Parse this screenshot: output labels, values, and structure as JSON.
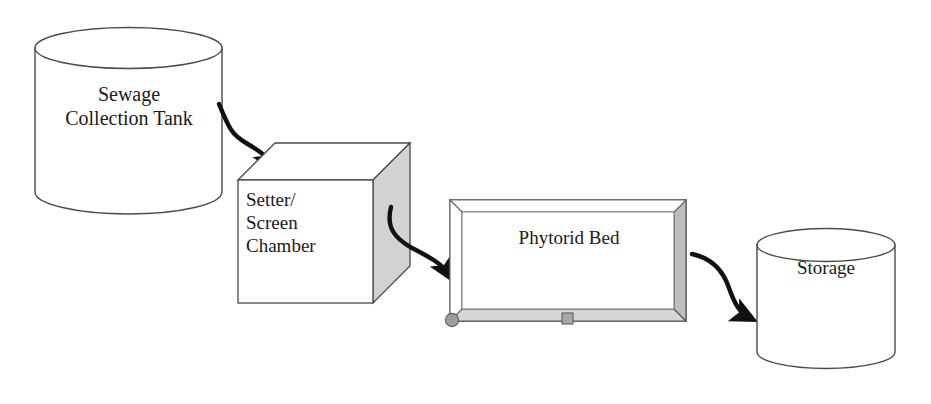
{
  "diagram": {
    "background_color": "#ffffff",
    "stroke_color": "#3a3a3a",
    "arrow_color": "#111111",
    "fill_white": "#ffffff",
    "fill_gray_light": "#d9d9d9",
    "fill_gray_mid": "#cfcfcf",
    "fill_gray_dark": "#9a9a9a",
    "nodes": [
      {
        "id": "sewage-collection-tank",
        "shape": "cylinder",
        "label": "Sewage\nCollection Tank",
        "label_line1": "Sewage",
        "label_line2": "Collection Tank"
      },
      {
        "id": "setter-screen-chamber",
        "shape": "cube",
        "label": "Setter/\nScreen\nChamber",
        "label_line1": "Setter/",
        "label_line2": "Screen",
        "label_line3": "Chamber"
      },
      {
        "id": "phytorid-bed",
        "shape": "open-box",
        "label": "Phytorid Bed"
      },
      {
        "id": "storage",
        "shape": "cylinder",
        "label": "Storage"
      }
    ],
    "connectors": [
      {
        "id": "arrow-tank-to-chamber",
        "from": "sewage-collection-tank",
        "to": "setter-screen-chamber",
        "style": "curved-arrow"
      },
      {
        "id": "arrow-chamber-to-bed",
        "from": "setter-screen-chamber",
        "to": "phytorid-bed",
        "style": "curved-arrow"
      },
      {
        "id": "arrow-bed-to-storage",
        "from": "phytorid-bed",
        "to": "storage",
        "style": "curved-arrow"
      }
    ],
    "markers": [
      {
        "id": "bed-corner-handle",
        "shape": "circle"
      },
      {
        "id": "bed-bottom-handle",
        "shape": "square"
      }
    ]
  }
}
